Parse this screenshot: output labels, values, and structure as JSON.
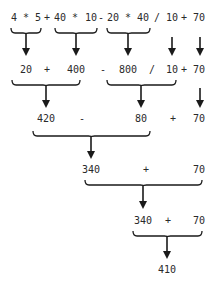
{
  "diagram": {
    "title": "",
    "steps": [
      {
        "name": "step-1-expression",
        "tokens": [
          {
            "text": "4",
            "x": 14
          },
          {
            "text": "*",
            "x": 26
          },
          {
            "text": "5",
            "x": 38
          },
          {
            "text": "+",
            "x": 47
          },
          {
            "text": "40",
            "x": 60
          },
          {
            "text": "*",
            "x": 75
          },
          {
            "text": "10",
            "x": 91
          },
          {
            "text": "-",
            "x": 101
          },
          {
            "text": "20",
            "x": 113
          },
          {
            "text": "*",
            "x": 128
          },
          {
            "text": "40",
            "x": 143
          },
          {
            "text": "/",
            "x": 157
          },
          {
            "text": "10",
            "x": 172
          },
          {
            "text": "+",
            "x": 184
          },
          {
            "text": "70",
            "x": 199
          }
        ],
        "y": 18
      },
      {
        "name": "step-2-after-multiplication",
        "tokens": [
          {
            "text": "20",
            "x": 26
          },
          {
            "text": "+",
            "x": 47
          },
          {
            "text": "400",
            "x": 76
          },
          {
            "text": "-",
            "x": 103
          },
          {
            "text": "800",
            "x": 128
          },
          {
            "text": "/",
            "x": 152
          },
          {
            "text": "10",
            "x": 172
          },
          {
            "text": "+",
            "x": 184
          },
          {
            "text": "70",
            "x": 199
          }
        ],
        "y": 70
      },
      {
        "name": "step-3-after-add-and-divide",
        "tokens": [
          {
            "text": "420",
            "x": 46
          },
          {
            "text": "-",
            "x": 82
          },
          {
            "text": "80",
            "x": 141
          },
          {
            "text": "+",
            "x": 173
          },
          {
            "text": "70",
            "x": 199
          }
        ],
        "y": 119
      },
      {
        "name": "step-4-after-subtraction",
        "tokens": [
          {
            "text": "340",
            "x": 91
          },
          {
            "text": "+",
            "x": 146
          },
          {
            "text": "70",
            "x": 199
          }
        ],
        "y": 170
      },
      {
        "name": "step-5-final-addition",
        "tokens": [
          {
            "text": "340",
            "x": 143
          },
          {
            "text": "+",
            "x": 168
          },
          {
            "text": "70",
            "x": 199
          }
        ],
        "y": 221
      },
      {
        "name": "step-6-result",
        "tokens": [
          {
            "text": "410",
            "x": 167
          }
        ],
        "y": 270
      }
    ],
    "braces": [
      {
        "x1": 11,
        "x2": 41,
        "y": 28
      },
      {
        "x1": 55,
        "x2": 97,
        "y": 28
      },
      {
        "x1": 107,
        "x2": 150,
        "y": 28
      },
      {
        "x1": 12,
        "x2": 80,
        "y": 80
      },
      {
        "x1": 107,
        "x2": 176,
        "y": 80
      },
      {
        "x1": 33,
        "x2": 150,
        "y": 131
      },
      {
        "x1": 85,
        "x2": 202,
        "y": 180
      },
      {
        "x1": 133,
        "x2": 202,
        "y": 231
      }
    ],
    "arrows": [
      {
        "x": 26,
        "y1": 33,
        "y2": 56
      },
      {
        "x": 76,
        "y1": 33,
        "y2": 56
      },
      {
        "x": 128,
        "y1": 33,
        "y2": 56
      },
      {
        "x": 172,
        "y1": 37,
        "y2": 56
      },
      {
        "x": 200,
        "y1": 37,
        "y2": 56
      },
      {
        "x": 46,
        "y1": 86,
        "y2": 108
      },
      {
        "x": 141,
        "y1": 86,
        "y2": 108
      },
      {
        "x": 200,
        "y1": 88,
        "y2": 108
      },
      {
        "x": 91,
        "y1": 137,
        "y2": 159
      },
      {
        "x": 143,
        "y1": 186,
        "y2": 209
      },
      {
        "x": 167,
        "y1": 236,
        "y2": 259
      }
    ],
    "colors": {
      "text": "#2a2a2a",
      "stroke": "#1a1a1a",
      "background": "#ffffff"
    }
  }
}
